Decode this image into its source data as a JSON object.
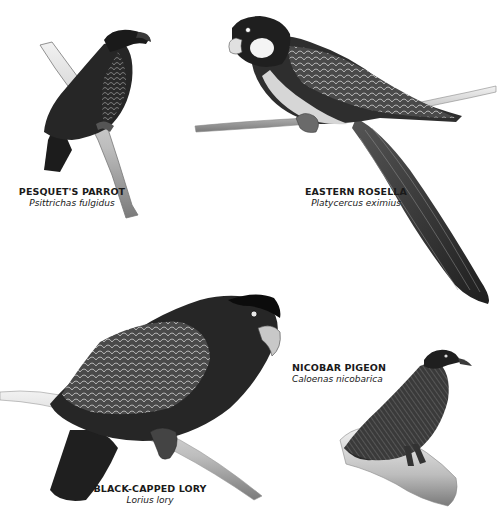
{
  "plate": {
    "background": "#ffffff",
    "birds": [
      {
        "id": "pesquets-parrot",
        "common_name": "PESQUET'S PARROT",
        "latin_name": "Psittrichas fulgidus",
        "caption_pos": {
          "x": 72,
          "y": 188
        }
      },
      {
        "id": "eastern-rosella",
        "common_name": "EASTERN ROSELLA",
        "latin_name": "Platycercus eximius",
        "caption_pos": {
          "x": 360,
          "y": 188
        }
      },
      {
        "id": "nicobar-pigeon",
        "common_name": "NICOBAR PIGEON",
        "latin_name": "Caloenas nicobarica",
        "caption_pos": {
          "x": 334,
          "y": 364
        }
      },
      {
        "id": "black-capped-lory",
        "common_name": "BLACK-CAPPED LORY",
        "latin_name": "Lorius lory",
        "caption_pos": {
          "x": 150,
          "y": 485
        }
      }
    ]
  }
}
